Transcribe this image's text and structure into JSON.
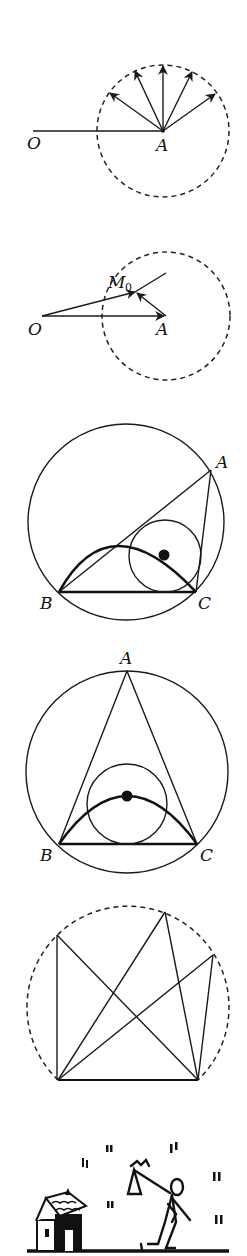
{
  "figures": [
    {
      "id": "fig-vectors-from-A",
      "labels": {
        "O": "O",
        "A": "A"
      }
    },
    {
      "id": "fig-tangent-M0",
      "labels": {
        "O": "O",
        "A": "A",
        "M": "M",
        "M_sub": "0"
      }
    },
    {
      "id": "fig-triangle-incircle-1",
      "labels": {
        "A": "A",
        "B": "B",
        "C": "C"
      }
    },
    {
      "id": "fig-triangle-incircle-2",
      "labels": {
        "A": "A",
        "B": "B",
        "C": "C"
      }
    },
    {
      "id": "fig-inscribed-lines",
      "labels": {}
    },
    {
      "id": "fig-cartoon-traveler",
      "labels": {}
    }
  ]
}
